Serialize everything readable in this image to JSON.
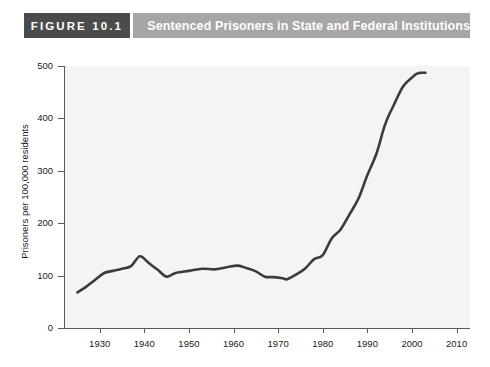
{
  "header": {
    "figure_number": "FIGURE 10.1",
    "title": "Sentenced Prisoners in State and Federal Institutions",
    "badge_color": "#4b4b4b",
    "title_bar_color": "#a6a6a6",
    "text_color": "#ffffff"
  },
  "chart_data": {
    "type": "line",
    "title": "Sentenced Prisoners in State and Federal Institutions",
    "xlabel": "",
    "ylabel": "Prisoners per 100,000 residents",
    "xlim": [
      1922,
      2013
    ],
    "ylim": [
      0,
      500
    ],
    "xticks": [
      1930,
      1940,
      1950,
      1960,
      1970,
      1980,
      1990,
      2000,
      2010
    ],
    "yticks": [
      0,
      100,
      200,
      300,
      400,
      500
    ],
    "xtick_labels": [
      "1930",
      "1940",
      "1950",
      "1960",
      "1970",
      "1980",
      "1990",
      "2000",
      "2010"
    ],
    "ytick_labels": [
      "0",
      "100",
      "200",
      "300",
      "400",
      "500"
    ],
    "grid": false,
    "legend": false,
    "line_color": "#3b3b3b",
    "plot_background": "#f4f4f4",
    "series": [
      {
        "name": "Sentenced prisoners per 100,000 residents",
        "x": [
          1925,
          1927,
          1929,
          1931,
          1933,
          1935,
          1937,
          1939,
          1941,
          1943,
          1945,
          1947,
          1950,
          1953,
          1956,
          1959,
          1961,
          1963,
          1965,
          1967,
          1969,
          1971,
          1972,
          1974,
          1976,
          1978,
          1980,
          1982,
          1984,
          1986,
          1988,
          1990,
          1992,
          1994,
          1996,
          1998,
          2000,
          2001,
          2002,
          2003
        ],
        "y": [
          68,
          79,
          92,
          105,
          109,
          113,
          118,
          137,
          124,
          111,
          98,
          105,
          109,
          113,
          112,
          117,
          119,
          114,
          108,
          98,
          97,
          95,
          93,
          102,
          113,
          131,
          139,
          171,
          188,
          217,
          247,
          292,
          332,
          389,
          427,
          461,
          478,
          485,
          487,
          487
        ]
      }
    ]
  }
}
